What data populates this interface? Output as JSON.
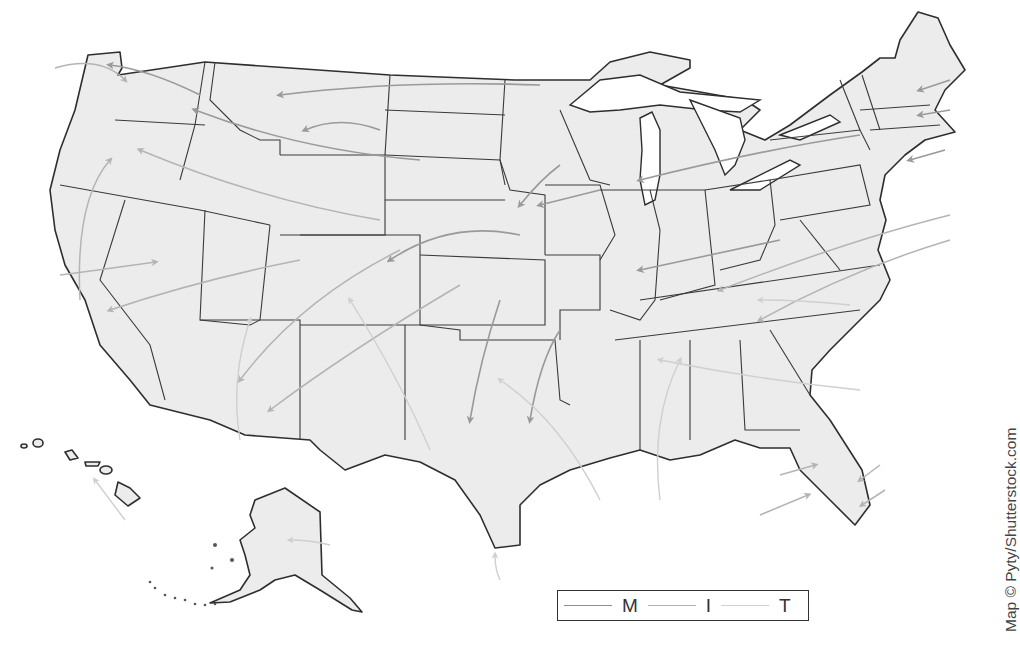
{
  "map": {
    "title": "United States air mass source flow map",
    "regions": [
      "Contiguous United States",
      "Alaska",
      "Hawaii"
    ],
    "colors": {
      "land": "#ececec",
      "border": "#2e2e2e",
      "flow_M": "#9a9a9a",
      "flow_I": "#b4b4b4",
      "flow_T": "#cfcfcf"
    }
  },
  "legend": {
    "items": [
      {
        "label": "M",
        "color": "#8f8f8f"
      },
      {
        "label": "I",
        "color": "#b0b0b0"
      },
      {
        "label": "T",
        "color": "#d2d2d2"
      }
    ]
  },
  "credit": {
    "text": "Map © Pyty/Shutterstock.com"
  }
}
